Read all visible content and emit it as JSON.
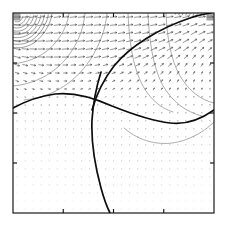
{
  "figure": {
    "title": "",
    "background_color": "#ffffff",
    "frame_color": "#111111",
    "width": 226,
    "height": 227
  },
  "chart_data": {
    "type": "scatter",
    "plot_kind": "quiver-with-contours",
    "title": "",
    "subtitle": "",
    "xlabel": "",
    "ylabel": "",
    "xlim": [
      0,
      1
    ],
    "ylim": [
      0,
      1
    ],
    "grid": false,
    "legend": null,
    "legend_position": "none",
    "annotations": [],
    "xticks": [
      0.0,
      0.25,
      0.5,
      0.75,
      1.0
    ],
    "xticklabels": [
      "",
      "",
      "",
      "",
      ""
    ],
    "yticks": [
      0.0,
      0.25,
      0.5,
      0.75,
      1.0
    ],
    "yticklabels": [
      "",
      "",
      "",
      "",
      ""
    ],
    "frame": {
      "left_px": 13,
      "top_px": 13,
      "right_px": 214,
      "bottom_px": 213
    },
    "tick_length_px": 4,
    "tick_positions_normalized": [
      0.0,
      0.25,
      0.5,
      0.75,
      1.0
    ],
    "vector_field": {
      "description": "regularly spaced arrow glyphs on a 25 x 25 grid filling the axes; arrows are near-horizontal pointing right along the top rows and shrink to dots in the lower half",
      "grid_nx": 25,
      "grid_ny": 25,
      "arrow_color": "#3c3c3c",
      "max_arrow_length_px": 7,
      "dominant_direction_top": "rightward-horizontal",
      "dominant_direction_bottom": "near-zero"
    },
    "vortices": [
      {
        "name": "top-left-vortex",
        "center_normalized": [
          0.02,
          0.98
        ],
        "center_px": [
          17,
          17
        ],
        "rings": 9,
        "sense": "clockwise",
        "color": "#4a4a4a"
      },
      {
        "name": "top-right-vortex",
        "center_normalized": [
          0.98,
          0.98
        ],
        "center_px": [
          209,
          17
        ],
        "rings": 9,
        "sense": "counter-clockwise",
        "color": "#4a4a4a"
      }
    ],
    "contours_thin": {
      "color": "#767676",
      "count": 7,
      "description": "large nested arcs sweeping from the top edge down through the interior, anchored near both upper corners"
    },
    "contours_bold": {
      "color": "#0d0d0d",
      "count": 3,
      "curves": [
        {
          "name": "bold-diagonal-upper-right",
          "description": "rises from mid-left interior up to the top-right corner"
        },
        {
          "name": "bold-wave-horizontal",
          "description": "enters at the left edge near y=0.47, crests near x=0.33, dips to a minimum near x=0.80, then rises to the right edge"
        },
        {
          "name": "bold-vertical-descending",
          "description": "descends from the upper interior near x=0.43 down through the bottom edge near x=0.40"
        }
      ]
    }
  }
}
